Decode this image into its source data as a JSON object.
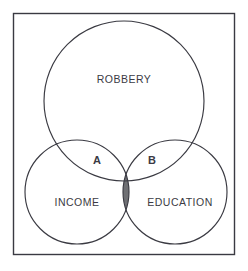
{
  "figure": {
    "kind": "venn-diagram",
    "set_count": 3,
    "frame": {
      "stroke_color": "#3a3a42",
      "fill_color": "#ffffff"
    },
    "circle_stroke_color": "#3a3a42",
    "shaded_region_color": "#6f7074",
    "label_color": "#3b3b44"
  },
  "sets": [
    {
      "id": "robbery",
      "label": "ROBBERY",
      "position": "top",
      "center_x": 124,
      "center_y": 101,
      "radius": 80,
      "label_x": 124,
      "label_y": 83
    },
    {
      "id": "income",
      "label": "INCOME",
      "position": "bottom-left",
      "center_x": 77,
      "center_y": 192,
      "radius": 52,
      "label_x": 77,
      "label_y": 206
    },
    {
      "id": "education",
      "label": "EDUCATION",
      "position": "bottom-right",
      "center_x": 175,
      "center_y": 192,
      "radius": 52,
      "label_x": 180,
      "label_y": 206
    }
  ],
  "regions": [
    {
      "id": "region-a",
      "label": "A",
      "description": "ROBBERY and INCOME overlap",
      "label_x": 97,
      "label_y": 164,
      "shaded": false
    },
    {
      "id": "region-b",
      "label": "B",
      "description": "ROBBERY and EDUCATION overlap",
      "label_x": 152,
      "label_y": 164,
      "shaded": false
    },
    {
      "id": "region-shaded",
      "label": "",
      "description": "INCOME and EDUCATION overlap (shaded)",
      "shaded": true
    }
  ]
}
